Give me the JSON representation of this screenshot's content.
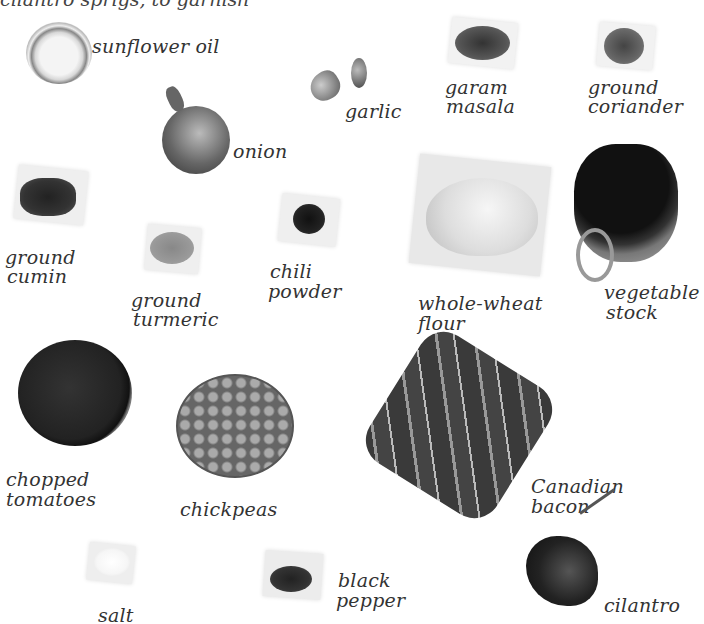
{
  "header": {
    "partial_text": "cilantro sprigs, to garnish"
  },
  "ingredients": [
    {
      "id": "sunflower-oil",
      "label": "sunflower oil"
    },
    {
      "id": "garlic",
      "label": "garlic"
    },
    {
      "id": "garam-masala",
      "label": "garam\nmasala",
      "l1": "garam",
      "l2": "masala"
    },
    {
      "id": "ground-coriander",
      "l1": "ground",
      "l2": "coriander"
    },
    {
      "id": "onion",
      "label": "onion"
    },
    {
      "id": "ground-cumin",
      "l1": "ground",
      "l2": "cumin"
    },
    {
      "id": "ground-turmeric",
      "l1": "ground",
      "l2": "turmeric"
    },
    {
      "id": "chili-powder",
      "l1": "chili",
      "l2": "powder"
    },
    {
      "id": "whole-wheat-flour",
      "l1": "whole-wheat",
      "l2": "flour"
    },
    {
      "id": "vegetable-stock",
      "l1": "vegetable",
      "l2": "stock"
    },
    {
      "id": "chopped-tomatoes",
      "l1": "chopped",
      "l2": "tomatoes"
    },
    {
      "id": "chickpeas",
      "label": "chickpeas"
    },
    {
      "id": "canadian-bacon",
      "l1": "Canadian",
      "l2": "bacon"
    },
    {
      "id": "salt",
      "label": "salt"
    },
    {
      "id": "black-pepper",
      "l1": "black",
      "l2": "pepper"
    },
    {
      "id": "cilantro",
      "label": "cilantro"
    }
  ]
}
